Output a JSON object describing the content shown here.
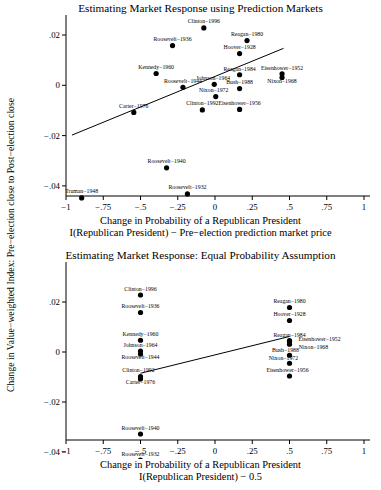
{
  "figure": {
    "shared_ylabel": "Change in Value−weighted Index: Pre−election close to Post−election close",
    "marker_color": "#000000",
    "line_color": "#000000",
    "axis_color": "#000000",
    "background": "#ffffff"
  },
  "chart_data": [
    {
      "type": "scatter",
      "title": "Estimating Market Response using Prediction Markets",
      "xlabel_line1": "Change in Probability of a Republican President",
      "xlabel_line2": "I(Republican President) − Pre−election prediction market price",
      "ylabel": "Change in Value−weighted Index: Pre−election close to Post−election close",
      "xlim": [
        -1,
        1
      ],
      "ylim": [
        -0.048,
        0.026
      ],
      "xticks": [
        -1,
        -0.75,
        -0.5,
        -0.25,
        0,
        0.25,
        0.5,
        0.75,
        1
      ],
      "xticklabels": [
        "−1",
        "−.75",
        "−.5",
        "−.25",
        "0",
        ".25",
        ".5",
        ".75",
        "1"
      ],
      "yticks": [
        0.02,
        0,
        -0.02,
        -0.04
      ],
      "yticklabels": [
        ".02",
        "0",
        "−.02",
        "−.04"
      ],
      "grid": false,
      "legend": "none",
      "fit_line": {
        "x": [
          -0.96,
          0.46
        ],
        "y": [
          -0.0198,
          0.0147
        ]
      },
      "points": [
        {
          "label": "Clinton−1996",
          "x": -0.075,
          "y": 0.0228,
          "label_dx": 0,
          "label_dy": -4.5,
          "label_anchor": "middle"
        },
        {
          "label": "Roosevelt−1936",
          "x": -0.285,
          "y": 0.0158,
          "label_dx": 0,
          "label_dy": -4.5,
          "label_anchor": "middle"
        },
        {
          "label": "Reagan−1980",
          "x": 0.215,
          "y": 0.0178,
          "label_dx": 0,
          "label_dy": -4.5,
          "label_anchor": "middle"
        },
        {
          "label": "Hoover−1928",
          "x": 0.165,
          "y": 0.0126,
          "label_dx": 0,
          "label_dy": -4.5,
          "label_anchor": "middle"
        },
        {
          "label": "Kennedy−1960",
          "x": -0.395,
          "y": 0.0047,
          "label_dx": 0,
          "label_dy": -4.5,
          "label_anchor": "middle"
        },
        {
          "label": "Reagan−1984",
          "x": 0.165,
          "y": 0.0042,
          "label_dx": 0,
          "label_dy": -4.2,
          "label_anchor": "middle"
        },
        {
          "label": "Eisenhower−1952",
          "x": 0.45,
          "y": 0.0046,
          "label_dx": 0,
          "label_dy": -4.2,
          "label_anchor": "middle"
        },
        {
          "label": "Johnson−1964",
          "x": -0.005,
          "y": 0.0004,
          "label_dx": -1,
          "label_dy": -4.2,
          "label_anchor": "middle"
        },
        {
          "label": "Roosevelt−1944",
          "x": -0.215,
          "y": -0.0008,
          "label_dx": 0,
          "label_dy": -4.5,
          "label_anchor": "middle"
        },
        {
          "label": "Bush−1988",
          "x": 0.165,
          "y": -0.0013,
          "label_dx": 0,
          "label_dy": -4.2,
          "label_anchor": "middle"
        },
        {
          "label": "Nixon−1968",
          "x": 0.45,
          "y": 0.0031,
          "label_dx": 0,
          "label_dy": 5.2,
          "label_anchor": "middle"
        },
        {
          "label": "Nixon−1972",
          "x": 0.005,
          "y": -0.0045,
          "label_dx": -2,
          "label_dy": -4.2,
          "label_anchor": "middle"
        },
        {
          "label": "Carter−1976",
          "x": -0.545,
          "y": -0.0108,
          "label_dx": 0,
          "label_dy": -4.5,
          "label_anchor": "middle"
        },
        {
          "label": "Clinton−1992",
          "x": -0.085,
          "y": -0.0098,
          "label_dx": 0,
          "label_dy": -4.5,
          "label_anchor": "middle"
        },
        {
          "label": "Eisenhower−1956",
          "x": 0.165,
          "y": -0.0096,
          "label_dx": 0,
          "label_dy": -4.5,
          "label_anchor": "middle"
        },
        {
          "label": "Roosevelt−1940",
          "x": -0.325,
          "y": -0.0328,
          "label_dx": 0,
          "label_dy": -4.5,
          "label_anchor": "middle"
        },
        {
          "label": "Roosevelt−1932",
          "x": -0.185,
          "y": -0.0432,
          "label_dx": 0,
          "label_dy": -4.5,
          "label_anchor": "middle"
        },
        {
          "label": "Truman−1948",
          "x": -0.895,
          "y": -0.0448,
          "label_dx": 0,
          "label_dy": -4.5,
          "label_anchor": "middle"
        }
      ]
    },
    {
      "type": "scatter",
      "title": "Estimating Market Response: Equal Probability Assumption",
      "xlabel_line1": "Change in Probability of a Republican President",
      "xlabel_line2": "I(Republican President) − 0.5",
      "ylabel": "Change in Value−weighted Index: Pre−election close to Post−election close",
      "xlim": [
        -1,
        1
      ],
      "ylim": [
        -0.048,
        0.026
      ],
      "xticks": [
        -1,
        -0.75,
        -0.5,
        -0.25,
        0,
        0.25,
        0.5,
        0.75,
        1
      ],
      "xticklabels": [
        "−1",
        "−.75",
        "−.5",
        "−.25",
        "0",
        ".25",
        ".5",
        ".75",
        "1"
      ],
      "yticks": [
        0.02,
        0,
        -0.02,
        -0.04
      ],
      "yticklabels": [
        ".02",
        "0",
        "−.02",
        "−.04"
      ],
      "grid": false,
      "legend": "none",
      "fit_line": {
        "x": [
          -0.5,
          0.5
        ],
        "y": [
          -0.0085,
          0.0062
        ]
      },
      "points": [
        {
          "label": "Clinton−1996",
          "x": -0.5,
          "y": 0.0228,
          "label_dx": 0,
          "label_dy": -4.5,
          "label_anchor": "middle"
        },
        {
          "label": "Roosevelt−1936",
          "x": -0.5,
          "y": 0.0158,
          "label_dx": 0,
          "label_dy": -4.5,
          "label_anchor": "middle"
        },
        {
          "label": "Reagan−1980",
          "x": 0.5,
          "y": 0.0178,
          "label_dx": 0,
          "label_dy": -4.5,
          "label_anchor": "middle"
        },
        {
          "label": "Hoover−1928",
          "x": 0.5,
          "y": 0.0126,
          "label_dx": 0,
          "label_dy": -4.5,
          "label_anchor": "middle"
        },
        {
          "label": "Kennedy−1960",
          "x": -0.5,
          "y": 0.0047,
          "label_dx": 0,
          "label_dy": -4.5,
          "label_anchor": "middle"
        },
        {
          "label": "Johnson−1964",
          "x": -0.5,
          "y": 0.0004,
          "label_dx": 0,
          "label_dy": -4.2,
          "label_anchor": "middle"
        },
        {
          "label": "Roosevelt−1944",
          "x": -0.5,
          "y": -0.0008,
          "label_dx": 0,
          "label_dy": 5.2,
          "label_anchor": "middle"
        },
        {
          "label": "Reagan−1984",
          "x": 0.5,
          "y": 0.0042,
          "label_dx": 0,
          "label_dy": -4.2,
          "label_anchor": "middle"
        },
        {
          "label": "Eisenhower−1952",
          "x": 0.5,
          "y": 0.0046,
          "label_dx": 30,
          "label_dy": 0.5,
          "label_anchor": "middle"
        },
        {
          "label": "Nixon−1968",
          "x": 0.5,
          "y": 0.0031,
          "label_dx": 24,
          "label_dy": 4.5,
          "label_anchor": "middle"
        },
        {
          "label": "Bush−1988",
          "x": 0.5,
          "y": -0.0013,
          "label_dx": -4,
          "label_dy": -3.6,
          "label_anchor": "middle"
        },
        {
          "label": "Nixon−1972",
          "x": 0.5,
          "y": -0.0045,
          "label_dx": -6,
          "label_dy": -3.6,
          "label_anchor": "middle"
        },
        {
          "label": "Clinton−1992",
          "x": -0.5,
          "y": -0.0098,
          "label_dx": -2,
          "label_dy": -4.2,
          "label_anchor": "middle"
        },
        {
          "label": "Carter−1976",
          "x": -0.5,
          "y": -0.0108,
          "label_dx": 0,
          "label_dy": 5.2,
          "label_anchor": "middle"
        },
        {
          "label": "Eisenhower−1956",
          "x": 0.5,
          "y": -0.0096,
          "label_dx": -2,
          "label_dy": -4.5,
          "label_anchor": "middle"
        },
        {
          "label": "Roosevelt−1940",
          "x": -0.5,
          "y": -0.0328,
          "label_dx": 0,
          "label_dy": -4.5,
          "label_anchor": "middle"
        },
        {
          "label": "Roosevelt−1932",
          "x": -0.5,
          "y": -0.0432,
          "label_dx": 0,
          "label_dy": -4.5,
          "label_anchor": "middle"
        },
        {
          "label": "Truman−1948",
          "x": -0.5,
          "y": -0.0448,
          "label_dx": 0,
          "label_dy": 5.2,
          "label_anchor": "middle"
        }
      ]
    }
  ]
}
